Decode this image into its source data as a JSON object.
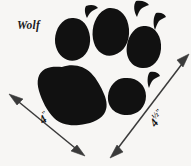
{
  "figure": {
    "background_color": "#f7f6f4",
    "ink_color": "#111111"
  },
  "species": {
    "label": "Wolf"
  },
  "dimensions": {
    "width": {
      "name": "track-width",
      "value": "4",
      "unit": "\"",
      "full_text": "4\"",
      "orientation_degrees": -39
    },
    "length": {
      "name": "track-length",
      "value": "4",
      "fraction": "½",
      "unit": "\"",
      "full_text": "4½\"",
      "orientation_degrees": -51
    }
  },
  "anatomy": {
    "heel_pad": "heel-pad",
    "toe_pads": [
      "toe-pad-outer-left",
      "toe-pad-inner-left",
      "toe-pad-inner-right",
      "toe-pad-outer-right"
    ],
    "claw_marks": [
      "claw-mark-left",
      "claw-mark-center",
      "claw-mark-right",
      "claw-mark-lower-right"
    ]
  },
  "arrows": {
    "width_arrow": "double-headed",
    "length_arrow": "double-headed"
  }
}
